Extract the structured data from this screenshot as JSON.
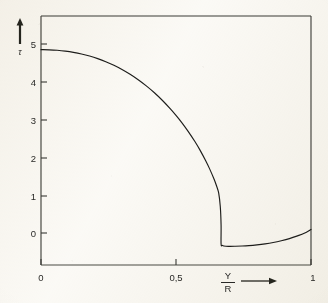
{
  "figure": {
    "kind": "scanned-line-plot",
    "paper_color": "#fbfaf7",
    "ink_color": "#1d1d1b"
  },
  "chart_data": {
    "type": "line",
    "title": "",
    "subtitle": "",
    "xlabel": "Y/R",
    "xlabel_numerator": "Y",
    "xlabel_denominator": "R",
    "ylabel": "τ",
    "xlim": [
      0,
      1
    ],
    "ylim": [
      -0.8,
      5.6
    ],
    "grid": false,
    "legend": null,
    "x_ticks": [
      0,
      0.5,
      1
    ],
    "x_tick_labels": [
      "0",
      "0,5",
      "1"
    ],
    "y_ticks": [
      0,
      1,
      2,
      3,
      4,
      5
    ],
    "y_tick_labels": [
      "0",
      "1",
      "2",
      "3",
      "4",
      "5"
    ],
    "decimal_separator": ",",
    "annotations": {
      "x_axis_arrow": "→",
      "y_axis_arrow": "↑"
    },
    "series": [
      {
        "name": "curve",
        "style": "solid",
        "color": "#1d1d1b",
        "x": [
          0.0,
          0.03,
          0.06,
          0.09,
          0.12,
          0.15,
          0.18,
          0.21,
          0.24,
          0.27,
          0.3,
          0.33,
          0.36,
          0.39,
          0.42,
          0.45,
          0.48,
          0.5,
          0.52,
          0.545,
          0.57,
          0.59,
          0.61,
          0.625,
          0.64,
          0.65,
          0.658,
          0.664,
          0.667,
          0.667,
          0.672,
          0.685,
          0.7,
          0.72,
          0.745,
          0.77,
          0.8,
          0.83,
          0.86,
          0.89,
          0.92,
          0.95,
          0.975,
          1.0
        ],
        "y": [
          4.85,
          4.846,
          4.834,
          4.812,
          4.78,
          4.737,
          4.682,
          4.614,
          4.532,
          4.436,
          4.325,
          4.198,
          4.054,
          3.892,
          3.71,
          3.506,
          3.278,
          3.113,
          2.935,
          2.69,
          2.42,
          2.18,
          1.91,
          1.69,
          1.44,
          1.25,
          1.06,
          0.7,
          0.2,
          -0.29,
          -0.33,
          -0.35,
          -0.352,
          -0.35,
          -0.345,
          -0.335,
          -0.315,
          -0.288,
          -0.252,
          -0.205,
          -0.148,
          -0.075,
          -0.005,
          0.095
        ],
        "description": "Smooth concave decay from about 4.85 at Y/R=0, a steep near-vertical drop at Y/R≈0.667 to a minimum of about -0.35, then a shallow recovery to about +0.10 at Y/R=1"
      }
    ],
    "key_points": {
      "start_value": 4.85,
      "discontinuity_x": 0.667,
      "minimum_value": -0.35,
      "end_value": 0.1
    }
  }
}
